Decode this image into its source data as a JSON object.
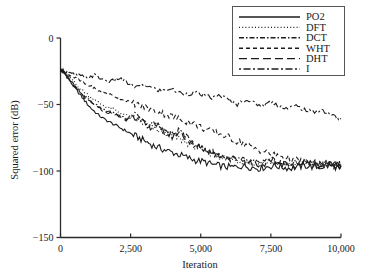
{
  "chart_data": {
    "type": "line",
    "title": "",
    "xlabel": "Iteration",
    "ylabel": "Squared error (dB)",
    "xlim": [
      0,
      10000
    ],
    "ylim": [
      -150,
      0
    ],
    "xticks": [
      0,
      2500,
      5000,
      7500,
      10000
    ],
    "xticklabels": [
      "0",
      "2,500",
      "5,000",
      "7,500",
      "10,000"
    ],
    "yticks": [
      0,
      -50,
      -100,
      -150
    ],
    "yticklabels": [
      "0",
      "−50",
      "−100",
      "−150"
    ],
    "grid": false,
    "legend_position": "upper right",
    "series": [
      {
        "name": "PO2",
        "style": "solid",
        "dash": "none",
        "color": "#1c1c1c",
        "x": [
          0,
          120,
          260,
          420,
          600,
          820,
          1050,
          1300,
          1560,
          1820,
          2080,
          2340,
          2600,
          2870,
          3150,
          3420,
          3700,
          3980,
          4260,
          4540,
          4820,
          5100,
          5380,
          5660,
          5940,
          6220,
          6500,
          6780,
          7060,
          7340,
          7620,
          7900,
          8180,
          8460,
          8740,
          9020,
          9300,
          9580,
          9860,
          10000
        ],
        "y": [
          -24,
          -26,
          -30,
          -35,
          -40,
          -46,
          -52,
          -57,
          -61,
          -64,
          -67,
          -70,
          -73,
          -76,
          -79,
          -82,
          -84,
          -86,
          -88,
          -90,
          -92,
          -93,
          -95,
          -96,
          -97,
          -97,
          -96,
          -97,
          -98,
          -97,
          -96,
          -97,
          -98,
          -97,
          -96,
          -97,
          -97,
          -96,
          -97,
          -97
        ]
      },
      {
        "name": "DFT",
        "style": "dotted",
        "dash": "1,2.2",
        "color": "#1c1c1c",
        "x": [
          0,
          120,
          260,
          420,
          600,
          820,
          1050,
          1300,
          1560,
          1820,
          2080,
          2340,
          2600,
          2870,
          3150,
          3420,
          3700,
          3980,
          4260,
          4540,
          4820,
          5100,
          5380,
          5660,
          5940,
          6220,
          6500,
          6780,
          7060,
          7340,
          7620,
          7900,
          8180,
          8460,
          8740,
          9020,
          9300,
          9580,
          9860,
          10000
        ],
        "y": [
          -24,
          -25,
          -28,
          -32,
          -36,
          -40,
          -44,
          -48,
          -51,
          -53,
          -56,
          -58,
          -61,
          -63,
          -66,
          -69,
          -71,
          -73,
          -76,
          -79,
          -82,
          -85,
          -87,
          -89,
          -91,
          -92,
          -93,
          -94,
          -95,
          -94,
          -93,
          -95,
          -96,
          -95,
          -94,
          -95,
          -96,
          -95,
          -95,
          -95
        ]
      },
      {
        "name": "DCT",
        "style": "dashdot",
        "dash": "5,2,1.5,2",
        "color": "#1c1c1c",
        "x": [
          0,
          120,
          260,
          420,
          600,
          820,
          1050,
          1300,
          1560,
          1820,
          2080,
          2340,
          2600,
          2870,
          3150,
          3420,
          3700,
          3980,
          4260,
          4540,
          4820,
          5100,
          5380,
          5660,
          5940,
          6220,
          6500,
          6780,
          7060,
          7340,
          7620,
          7900,
          8180,
          8460,
          8740,
          9020,
          9300,
          9580,
          9860,
          10000
        ],
        "y": [
          -24,
          -25,
          -29,
          -33,
          -38,
          -43,
          -47,
          -51,
          -54,
          -55,
          -58,
          -61,
          -57,
          -62,
          -66,
          -64,
          -70,
          -73,
          -69,
          -76,
          -80,
          -83,
          -86,
          -88,
          -90,
          -91,
          -92,
          -93,
          -94,
          -93,
          -92,
          -94,
          -95,
          -94,
          -93,
          -95,
          -95,
          -94,
          -95,
          -95
        ]
      },
      {
        "name": "WHT",
        "style": "dashed-short",
        "dash": "4,3",
        "color": "#1c1c1c",
        "x": [
          0,
          120,
          260,
          420,
          600,
          820,
          1050,
          1300,
          1560,
          1820,
          2080,
          2340,
          2600,
          2870,
          3150,
          3420,
          3700,
          3980,
          4260,
          4540,
          4820,
          5100,
          5380,
          5660,
          5940,
          6220,
          6500,
          6780,
          7060,
          7340,
          7620,
          7900,
          8180,
          8460,
          8740,
          9020,
          9300,
          9580,
          9860,
          10000
        ],
        "y": [
          -24,
          -25,
          -27,
          -29,
          -31,
          -34,
          -36,
          -39,
          -41,
          -43,
          -45,
          -47,
          -49,
          -51,
          -53,
          -55,
          -57,
          -59,
          -61,
          -63,
          -65,
          -68,
          -70,
          -72,
          -74,
          -77,
          -79,
          -82,
          -84,
          -86,
          -88,
          -89,
          -91,
          -92,
          -93,
          -94,
          -94,
          -95,
          -95,
          -95
        ]
      },
      {
        "name": "DHT",
        "style": "dashed-long",
        "dash": "8,4",
        "color": "#1c1c1c",
        "x": [
          0,
          120,
          260,
          420,
          600,
          820,
          1050,
          1300,
          1560,
          1820,
          2080,
          2340,
          2600,
          2870,
          3150,
          3420,
          3700,
          3980,
          4260,
          4540,
          4820,
          5100,
          5380,
          5660,
          5940,
          6220,
          6500,
          6780,
          7060,
          7340,
          7620,
          7900,
          8180,
          8460,
          8740,
          9020,
          9300,
          9580,
          9860,
          10000
        ],
        "y": [
          -24,
          -26,
          -30,
          -34,
          -39,
          -44,
          -48,
          -52,
          -55,
          -57,
          -59,
          -62,
          -58,
          -63,
          -67,
          -65,
          -71,
          -74,
          -70,
          -77,
          -81,
          -84,
          -86,
          -88,
          -90,
          -91,
          -92,
          -94,
          -95,
          -94,
          -93,
          -95,
          -96,
          -95,
          -94,
          -96,
          -96,
          -95,
          -96,
          -96
        ]
      },
      {
        "name": "I",
        "style": "dashdot-mixed",
        "dash": "2,2.5,7,2.5",
        "color": "#1c1c1c",
        "x": [
          0,
          150,
          350,
          600,
          900,
          1200,
          1500,
          1800,
          2100,
          2400,
          2700,
          3000,
          3300,
          3600,
          3900,
          4200,
          4500,
          4800,
          5100,
          5400,
          5700,
          6000,
          6300,
          6600,
          6900,
          7200,
          7500,
          7800,
          8100,
          8400,
          8700,
          9000,
          9300,
          9600,
          9850,
          10000
        ],
        "y": [
          -24,
          -25,
          -27,
          -28,
          -30,
          -28,
          -31,
          -33,
          -30,
          -34,
          -37,
          -35,
          -38,
          -40,
          -38,
          -41,
          -42,
          -41,
          -43,
          -45,
          -43,
          -47,
          -50,
          -46,
          -49,
          -51,
          -48,
          -51,
          -53,
          -51,
          -54,
          -56,
          -54,
          -57,
          -60,
          -61
        ]
      }
    ]
  },
  "legend": {
    "entries": [
      {
        "label": "PO2"
      },
      {
        "label": "DFT"
      },
      {
        "label": "DCT"
      },
      {
        "label": "WHT"
      },
      {
        "label": "DHT"
      },
      {
        "label": "I"
      }
    ]
  }
}
